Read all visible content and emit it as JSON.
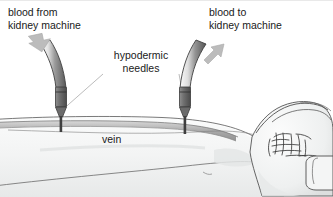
{
  "diagram": {
    "type": "medical-illustration",
    "labels": {
      "blood_from": "blood from\nkidney machine",
      "blood_to": "blood to\nkidney machine",
      "needles": "hypodermic\nneedles",
      "vein": "vein"
    },
    "parts": [
      {
        "name": "inflow-tube",
        "label": "blood from kidney machine",
        "side": "left"
      },
      {
        "name": "outflow-tube",
        "label": "blood to kidney machine",
        "side": "right"
      },
      {
        "name": "hypodermic-needle-left",
        "label": "hypodermic needle"
      },
      {
        "name": "hypodermic-needle-right",
        "label": "hypodermic needle"
      },
      {
        "name": "vein",
        "label": "vein"
      },
      {
        "name": "forearm",
        "label": "forearm"
      },
      {
        "name": "clenched-fist",
        "label": "clenched fist"
      }
    ],
    "arrows": [
      {
        "name": "inflow-arrow",
        "direction": "down-right",
        "meaning": "blood entering arm from machine"
      },
      {
        "name": "outflow-arrow",
        "direction": "up-right",
        "meaning": "blood leaving arm to machine"
      }
    ],
    "colors": {
      "text": "#1a1a1a",
      "skin_fill": "#f2f3f3",
      "skin_shade": "#dfe1e1",
      "outline": "#3c3c3c",
      "tube_dark": "#5e5e5e",
      "tube_light": "#f4f4f4",
      "needle": "#6d6d6d",
      "needle_dark": "#4a4a4a",
      "vein": "#9a9a9a",
      "arrow": "#b9b9b9",
      "leader": "#b5b5b5"
    }
  }
}
